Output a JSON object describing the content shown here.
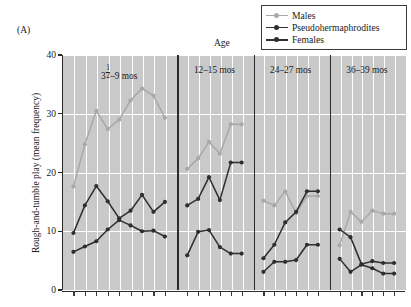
{
  "figure": {
    "letter": "(A)",
    "x_axis_title": "Age",
    "y_axis_title": "Rough-and-tumble play (mean frequency)"
  },
  "legend": {
    "position": "top-right",
    "items": [
      {
        "label": "Males",
        "color": "#a8a8a8",
        "marker": "circle"
      },
      {
        "label": "Pseudohermaphrodites",
        "color": "#2e2e2e",
        "marker": "circle"
      },
      {
        "label": "Females",
        "color": "#2e2e2e",
        "marker": "circle"
      }
    ]
  },
  "colors": {
    "males": "#a8a8a8",
    "pseudohermaphrodites": "#2e2e2e",
    "females": "#2e2e2e",
    "plot_background": "#c9c9c9",
    "gridline": "#ffffff",
    "axis": "#2b2b2b"
  },
  "chart_data": {
    "type": "line",
    "title": "",
    "xlabel": "Age",
    "ylabel": "Rough-and-tumble play (mean frequency)",
    "ylim": [
      0,
      40
    ],
    "yticks": [
      0,
      10,
      20,
      30,
      40
    ],
    "grid": true,
    "legend_position": "top-right",
    "panels": [
      {
        "label": "3½–9 mos",
        "label_parts": {
          "prefix": "3",
          "fraction_num": "1",
          "fraction_den": "2",
          "suffix": "–9 mos"
        },
        "n_points": 9,
        "x": [
          1,
          2,
          3,
          4,
          5,
          6,
          7,
          8,
          9
        ],
        "series": [
          {
            "name": "Males",
            "values": [
              17.6,
              24.8,
              30.5,
              27.4,
              29.0,
              32.3,
              34.3,
              33.1,
              29.3
            ]
          },
          {
            "name": "Pseudohermaphrodites",
            "values": [
              9.7,
              14.4,
              17.7,
              15.1,
              12.2,
              13.5,
              16.2,
              13.3,
              15.0
            ]
          },
          {
            "name": "Females",
            "values": [
              6.5,
              7.4,
              8.3,
              10.3,
              11.9,
              11.0,
              10.0,
              10.1,
              9.1
            ]
          }
        ]
      },
      {
        "label": "12–15 mos",
        "n_points": 6,
        "x": [
          1,
          2,
          3,
          4,
          5,
          6
        ],
        "series": [
          {
            "name": "Males",
            "values": [
              20.6,
              22.4,
              25.2,
              23.2,
              28.2,
              28.2
            ]
          },
          {
            "name": "Pseudohermaphrodites",
            "values": [
              14.4,
              15.5,
              19.2,
              15.3,
              21.7,
              21.7
            ]
          },
          {
            "name": "Females",
            "values": [
              5.9,
              9.9,
              10.2,
              7.3,
              6.2,
              6.2
            ]
          }
        ]
      },
      {
        "label": "24–27 mos",
        "n_points": 6,
        "x": [
          1,
          2,
          3,
          4,
          5,
          6
        ],
        "series": [
          {
            "name": "Males",
            "values": [
              15.2,
              14.4,
              16.8,
              13.1,
              16.0,
              16.0
            ]
          },
          {
            "name": "Pseudohermaphrodites",
            "values": [
              5.4,
              7.7,
              11.5,
              13.3,
              16.8,
              16.8
            ]
          },
          {
            "name": "Females",
            "values": [
              3.1,
              4.8,
              4.8,
              5.1,
              7.7,
              7.7
            ]
          }
        ]
      },
      {
        "label": "36–39 mos",
        "n_points": 6,
        "x": [
          1,
          2,
          3,
          4,
          5,
          6
        ],
        "series": [
          {
            "name": "Males",
            "values": [
              7.6,
              13.3,
              11.6,
              13.5,
              13.0,
              13.0
            ]
          },
          {
            "name": "Pseudohermaphrodites",
            "values": [
              10.3,
              9.0,
              4.4,
              4.9,
              4.6,
              4.6
            ]
          },
          {
            "name": "Females",
            "values": [
              5.3,
              3.1,
              4.3,
              3.7,
              2.8,
              2.8
            ]
          }
        ]
      }
    ]
  }
}
